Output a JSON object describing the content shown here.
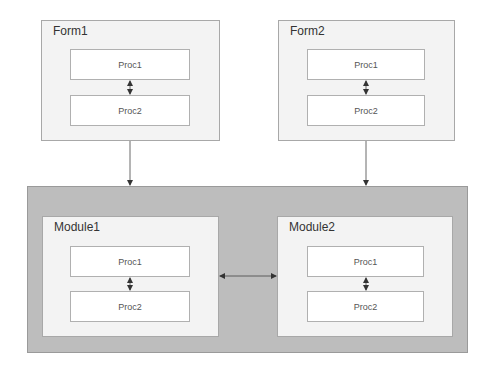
{
  "diagram": {
    "forms": [
      {
        "id": "form1",
        "title": "Form1",
        "procs": [
          "Proc1",
          "Proc2"
        ]
      },
      {
        "id": "form2",
        "title": "Form2",
        "procs": [
          "Proc1",
          "Proc2"
        ]
      }
    ],
    "module_container": {
      "modules": [
        {
          "id": "module1",
          "title": "Module1",
          "procs": [
            "Proc1",
            "Proc2"
          ]
        },
        {
          "id": "module2",
          "title": "Module2",
          "procs": [
            "Proc1",
            "Proc2"
          ]
        }
      ]
    },
    "connections": [
      {
        "from": "form1",
        "to": "module_container",
        "type": "arrow"
      },
      {
        "from": "form2",
        "to": "module_container",
        "type": "arrow"
      },
      {
        "from": "module1",
        "to": "module2",
        "type": "bidirectional"
      },
      {
        "from": "form1.Proc1",
        "to": "form1.Proc2",
        "type": "bidirectional"
      },
      {
        "from": "form2.Proc1",
        "to": "form2.Proc2",
        "type": "bidirectional"
      },
      {
        "from": "module1.Proc1",
        "to": "module1.Proc2",
        "type": "bidirectional"
      },
      {
        "from": "module2.Proc1",
        "to": "module2.Proc2",
        "type": "bidirectional"
      }
    ],
    "colors": {
      "container": "#bdbdbd",
      "group": "#f3f3f3",
      "proc": "#ffffff",
      "line": "#333333"
    }
  }
}
